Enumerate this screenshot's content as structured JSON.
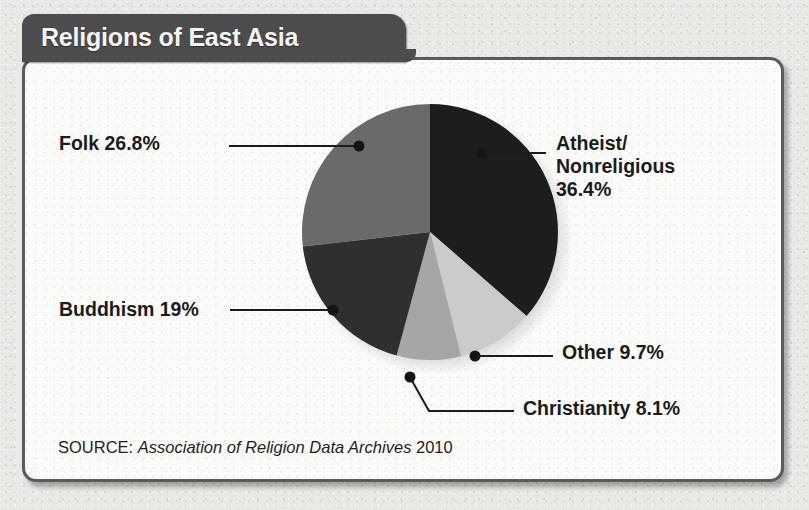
{
  "header": {
    "title": "Religions of East Asia"
  },
  "source": {
    "label": "SOURCE:",
    "name": "Association of Religion Data Archives",
    "year": "2010"
  },
  "labels": {
    "folk": "Folk 26.8%",
    "buddhism": "Buddhism 19%",
    "atheist": "Atheist/\nNonreligious\n36.4%",
    "atheist_line1": "Atheist/",
    "atheist_line2": "Nonreligious",
    "atheist_line3": "36.4%",
    "other": "Other 9.7%",
    "christianity": "Christianity 8.1%"
  },
  "colors": {
    "atheist": "#1d1d1d",
    "other": "#cbcbcb",
    "christianity": "#a6a6a6",
    "buddhism": "#2f2f2f",
    "folk": "#6a6a6a",
    "title_tab": "#4c4c4c",
    "panel_border": "#5a5a5a",
    "panel_bg": "#fbfbfa",
    "page_bg": "#e9e8e5",
    "text": "#1b1b1b",
    "leader": "#1b1b1b"
  },
  "chart_data": {
    "type": "pie",
    "title": "Religions of East Asia",
    "source": "SOURCE: Association of Religion Data Archives 2010",
    "unit": "percent",
    "total": 100.0,
    "start_angle_deg": 0,
    "direction": "clockwise",
    "legend": "none (direct labels with leader lines)",
    "labels": [
      "Atheist/Nonreligious",
      "Other",
      "Christianity",
      "Buddhism",
      "Folk"
    ],
    "values": [
      36.4,
      9.7,
      8.1,
      19.0,
      26.8
    ],
    "slices": [
      {
        "label": "Atheist/Nonreligious",
        "value": 36.4,
        "display": "36.4%",
        "color": "#1d1d1d",
        "start_deg": 0.0,
        "end_deg": 131.04
      },
      {
        "label": "Other",
        "value": 9.7,
        "display": "9.7%",
        "color": "#cbcbcb",
        "start_deg": 131.04,
        "end_deg": 165.96
      },
      {
        "label": "Christianity",
        "value": 8.1,
        "display": "8.1%",
        "color": "#a6a6a6",
        "start_deg": 165.96,
        "end_deg": 195.12
      },
      {
        "label": "Buddhism",
        "value": 19.0,
        "display": "19%",
        "color": "#2f2f2f",
        "start_deg": 195.12,
        "end_deg": 263.52
      },
      {
        "label": "Folk",
        "value": 26.8,
        "display": "26.8%",
        "color": "#6a6a6a",
        "start_deg": 263.52,
        "end_deg": 360.0
      }
    ]
  }
}
